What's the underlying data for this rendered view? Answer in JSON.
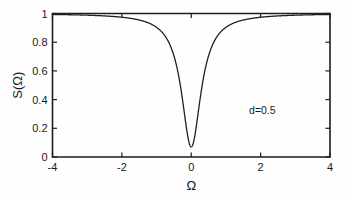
{
  "chart_data": {
    "type": "line",
    "title": "",
    "xlabel": "Ω",
    "ylabel": "S(Ω)",
    "xlim": [
      -4,
      4
    ],
    "ylim": [
      0,
      1
    ],
    "xticks": [
      -4,
      -2,
      0,
      2,
      4
    ],
    "xticklabels": [
      "-4",
      "-2",
      "0",
      "2",
      "4"
    ],
    "yticks": [
      0,
      0.2,
      0.4,
      0.6,
      0.8,
      1
    ],
    "yticklabels": [
      "0",
      "0.2",
      "0.4",
      "0.6",
      "0.8",
      "1"
    ],
    "grid": false,
    "legend": null,
    "annotations": [
      {
        "text": "d=0.5",
        "x": 2.05,
        "y": 0.3
      }
    ],
    "series": [
      {
        "name": "S(Ω)",
        "color": "#1f1f1f",
        "linewidth": 1.3,
        "description": "Lorentzian-type absorption dip centred at Ω = 0, baseline 1, minimum 0.07, half-width at half-depth ≈ 0.34",
        "minimum": {
          "x": 0.0,
          "y": 0.07
        },
        "baseline": 1.0,
        "hwhm": 0.34,
        "x": [
          -4.0,
          -3.5,
          -3.0,
          -2.5,
          -2.0,
          -1.6,
          -1.3,
          -1.1,
          -0.95,
          -0.85,
          -0.75,
          -0.65,
          -0.55,
          -0.48,
          -0.42,
          -0.36,
          -0.3,
          -0.25,
          -0.2,
          -0.15,
          -0.1,
          -0.06,
          -0.03,
          0.0,
          0.03,
          0.06,
          0.1,
          0.15,
          0.2,
          0.25,
          0.3,
          0.36,
          0.42,
          0.48,
          0.55,
          0.65,
          0.75,
          0.85,
          0.95,
          1.1,
          1.3,
          1.6,
          2.0,
          2.5,
          3.0,
          3.5,
          4.0
        ],
        "y": [
          0.9975,
          0.9968,
          0.9957,
          0.9941,
          0.9912,
          0.9871,
          0.9808,
          0.9739,
          0.9664,
          0.9595,
          0.9501,
          0.9371,
          0.9181,
          0.9001,
          0.8801,
          0.8536,
          0.8178,
          0.78,
          0.727,
          0.651,
          0.543,
          0.419,
          0.261,
          0.07,
          0.261,
          0.419,
          0.543,
          0.651,
          0.727,
          0.78,
          0.8178,
          0.8536,
          0.8801,
          0.9001,
          0.9181,
          0.9371,
          0.9501,
          0.9595,
          0.9664,
          0.9739,
          0.9808,
          0.9871,
          0.9912,
          0.9941,
          0.9957,
          0.9968,
          0.9975
        ]
      }
    ]
  }
}
